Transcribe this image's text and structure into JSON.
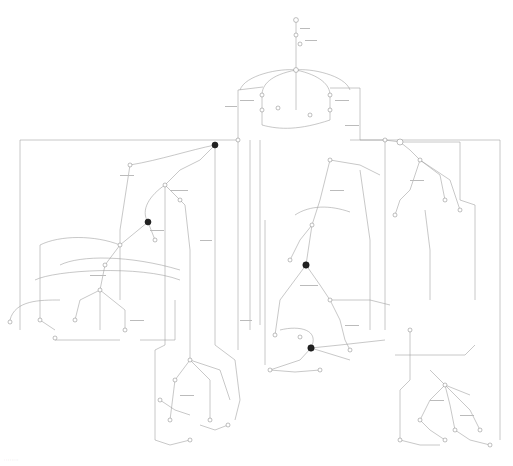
{
  "diagram": {
    "type": "state-machine-graph",
    "colors": {
      "edge": "#9a9a9a",
      "node_stroke": "#8a8a8a",
      "node_fill": "#ffffff",
      "highlight_node": "#222222"
    },
    "start_node": {
      "x": 296,
      "y": 20
    },
    "highlighted_nodes": [
      {
        "x": 215,
        "y": 145
      },
      {
        "x": 148,
        "y": 222
      },
      {
        "x": 306,
        "y": 265
      },
      {
        "x": 311,
        "y": 348
      },
      {
        "x": 400,
        "y": 142
      }
    ],
    "footer_text": "· · · · · · · ·"
  }
}
